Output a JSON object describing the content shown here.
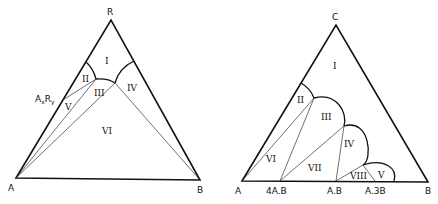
{
  "diagrams": [
    {
      "id": "left",
      "vertices": {
        "top": "R",
        "left": "A",
        "right": "B"
      },
      "compound_label": {
        "base": "A",
        "sub1": "x",
        "mid": "R",
        "sub2": "y"
      },
      "regions": [
        "I",
        "II",
        "III",
        "IV",
        "V",
        "VI"
      ]
    },
    {
      "id": "right",
      "vertices": {
        "top": "C",
        "left": "A",
        "right": "B"
      },
      "base_labels": [
        "4A.B",
        "A.B",
        "A.3B"
      ],
      "regions": [
        "I",
        "II",
        "III",
        "IV",
        "V",
        "VI",
        "VII",
        "VIII"
      ]
    }
  ]
}
